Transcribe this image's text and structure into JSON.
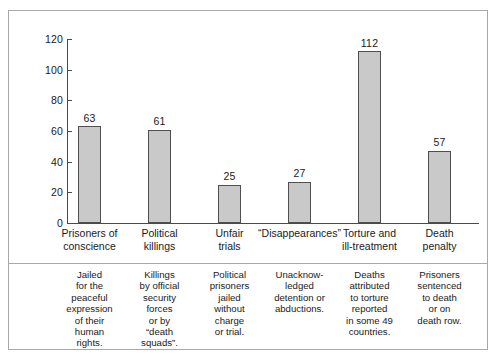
{
  "chart_data": {
    "type": "bar",
    "title": "",
    "subtitle": "",
    "xlabel": "",
    "ylabel": "",
    "ylim": [
      0,
      120
    ],
    "yticks": [
      0,
      20,
      40,
      60,
      80,
      100,
      120
    ],
    "grid": false,
    "legend": false,
    "categories": [
      "Prisoners of conscience",
      "Political killings",
      "Unfair trials",
      "“Disappearances”",
      "Torture and ill-treatment",
      "Death penalty"
    ],
    "values": [
      63,
      61,
      25,
      27,
      112,
      57
    ],
    "value_labels": [
      "63",
      "61",
      "25",
      "27",
      "112",
      "57"
    ],
    "annotations": [
      "Jailed for the peaceful expression of their human rights.",
      "Killings by official security forces or by “death squads”.",
      "Political prisoners jailed without charge or trial.",
      "Unacknow-ledged detention or abductions.",
      "Deaths attributed to torture reported in some 49 countries.",
      "Prisoners sentenced to death or on death row."
    ]
  },
  "axis": {
    "tick_labels": [
      "120",
      "100",
      "80",
      "60",
      "40",
      "20",
      "0"
    ]
  },
  "categories": [
    {
      "label": "Prisoners of conscience",
      "line1": "Prisoners of",
      "line2": "conscience"
    },
    {
      "label": "Political killings",
      "line1": "Political",
      "line2": "killings"
    },
    {
      "label": "Unfair trials",
      "line1": "Unfair",
      "line2": "trials"
    },
    {
      "label": "“Disappearances”",
      "line1": "“Disappearances”",
      "line2": ""
    },
    {
      "label": "Torture and ill-treatment",
      "line1": "Torture and",
      "line2": "ill-treatment"
    },
    {
      "label": "Death penalty",
      "line1": "Death",
      "line2": "penalty"
    }
  ],
  "bars": [
    {
      "value_label": "63"
    },
    {
      "value_label": "61"
    },
    {
      "value_label": "25"
    },
    {
      "value_label": "27"
    },
    {
      "value_label": "112"
    },
    {
      "value_label": "57"
    }
  ],
  "notes": [
    {
      "text": "Jailed\nfor the\npeaceful\nexpression\nof their\nhuman\nrights."
    },
    {
      "text": "Killings\nby official\nsecurity\nforces\nor by\n“death\nsquads”."
    },
    {
      "text": "Political\nprisoners\njailed\nwithout\ncharge\nor trial."
    },
    {
      "text": "Unacknow-\nledged\ndetention or\nabductions."
    },
    {
      "text": "Deaths\nattributed\nto torture\nreported\nin some 49\ncountries."
    },
    {
      "text": "Prisoners\nsentenced\nto death\nor on\ndeath row."
    }
  ],
  "style": {
    "bar_fill": "#c9c9c9",
    "bar_stroke": "#4f4f4f",
    "axis_color": "#4a4a4a",
    "border_color": "#a8a8a8",
    "text_color": "#1a1a1a",
    "background": "#ffffff"
  }
}
